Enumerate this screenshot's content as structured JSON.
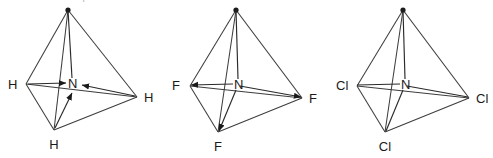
{
  "figure": {
    "caption_top_cropped": "Which of these is polar?",
    "background_color": "#ffffff",
    "line_color": "#3d3d3d",
    "label_color": "#1a1a1a",
    "width": 493,
    "height": 158
  },
  "diagrams": [
    {
      "id": "diagram-nh3",
      "center_label": "N",
      "outer_labels": [
        "H",
        "H",
        "H"
      ],
      "left_label": "H",
      "right_label": "H",
      "bottom_label": "H",
      "dipole_direction": "inward",
      "has_arrowheads": true,
      "shape": "tetrahedron"
    },
    {
      "id": "diagram-nf3",
      "center_label": "N",
      "outer_labels": [
        "F",
        "F",
        "F"
      ],
      "left_label": "F",
      "right_label": "F",
      "bottom_label": "F",
      "dipole_direction": "outward",
      "has_arrowheads": true,
      "shape": "tetrahedron"
    },
    {
      "id": "diagram-ncl3",
      "center_label": "N",
      "outer_labels": [
        "Cl",
        "Cl",
        "Cl"
      ],
      "left_label": "Cl",
      "right_label": "Cl",
      "bottom_label": "Cl",
      "dipole_direction": "none",
      "has_arrowheads": false,
      "shape": "tetrahedron"
    }
  ]
}
